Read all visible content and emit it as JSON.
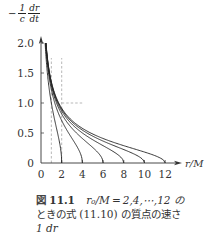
{
  "chart_data": {
    "type": "line",
    "title": "",
    "xlabel": "r/M",
    "ylabel": "-(1/c) dr/dt",
    "ylabel_parts": {
      "minus": "−",
      "frac_num": "1",
      "frac_den": "c",
      "deriv_num": "dr",
      "deriv_den": "dt"
    },
    "xlim": [
      0,
      13
    ],
    "ylim": [
      0,
      2.0
    ],
    "x_ticks": [
      "0",
      "2",
      "4",
      "6",
      "8",
      "10",
      "12"
    ],
    "x_tick_values": [
      0,
      2,
      4,
      6,
      8,
      10,
      12
    ],
    "y_ticks": [
      "0",
      "0.5",
      "1.0",
      "1.5",
      "2.0"
    ],
    "y_tick_values": [
      0,
      0.5,
      1.0,
      1.5,
      2.0
    ],
    "grid": false,
    "legend": null,
    "series": [
      {
        "name": "r0/M=2",
        "r0": 2,
        "x": [
          2.0,
          1.5,
          1.0,
          0.75,
          0.5
        ],
        "values": [
          0.0,
          0.58,
          1.0,
          1.29,
          1.73
        ]
      },
      {
        "name": "r0/M=4",
        "r0": 4,
        "x": [
          4.0,
          3.0,
          2.0,
          1.0,
          0.5
        ],
        "values": [
          0.0,
          0.41,
          0.71,
          1.22,
          1.87
        ]
      },
      {
        "name": "r0/M=6",
        "r0": 6,
        "x": [
          6.0,
          4.0,
          2.0,
          1.0,
          0.5
        ],
        "values": [
          0.0,
          0.41,
          0.82,
          1.29,
          1.91
        ]
      },
      {
        "name": "r0/M=8",
        "r0": 8,
        "x": [
          8.0,
          6.0,
          4.0,
          2.0,
          1.0,
          0.5
        ],
        "values": [
          0.0,
          0.29,
          0.5,
          0.87,
          1.32,
          1.94
        ]
      },
      {
        "name": "r0/M=10",
        "r0": 10,
        "x": [
          10.0,
          8.0,
          6.0,
          4.0,
          2.0,
          1.0,
          0.5
        ],
        "values": [
          0.0,
          0.22,
          0.37,
          0.55,
          0.89,
          1.34,
          1.95
        ]
      },
      {
        "name": "r0/M=12",
        "r0": 12,
        "x": [
          12.0,
          10.0,
          8.0,
          6.0,
          4.0,
          2.0,
          1.0,
          0.5
        ],
        "values": [
          0.0,
          0.18,
          0.29,
          0.41,
          0.58,
          0.91,
          1.35,
          1.96
        ]
      }
    ],
    "reference_lines": [
      {
        "type": "vertical",
        "x": 1,
        "y_range": [
          0,
          1.75
        ],
        "style": "dashed"
      },
      {
        "type": "vertical",
        "x": 2,
        "y_range": [
          0,
          1.75
        ],
        "style": "dashed"
      },
      {
        "type": "horizontal",
        "y": 1.0,
        "x_range": [
          2,
          4
        ],
        "style": "dashed"
      }
    ]
  },
  "caption": {
    "figure_label": "図",
    "figure_number": "11.1",
    "line1_text": "r₀/M = 2,4,⋯,12 の",
    "line2_text": "ときの式 (11.10) の質点の速さ",
    "line3_text": "1 dr"
  }
}
